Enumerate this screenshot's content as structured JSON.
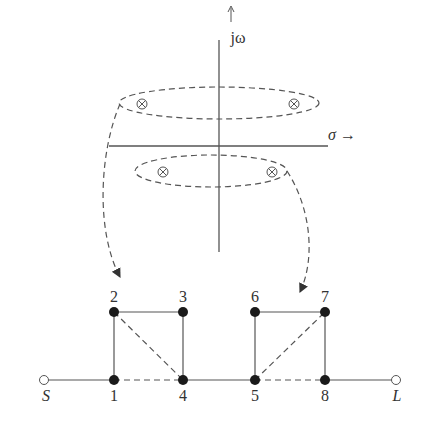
{
  "pole_zero_plot": {
    "axis_labels": {
      "imag": "jω",
      "real": "σ →",
      "imag_arrow": "↑"
    },
    "upper_pair": {
      "marker": "⊗",
      "count": 2
    },
    "lower_pair": {
      "marker": "⊗",
      "count": 2
    }
  },
  "network": {
    "source_label": "S",
    "load_label": "L",
    "nodes": [
      {
        "id": "1",
        "label": "1"
      },
      {
        "id": "2",
        "label": "2"
      },
      {
        "id": "3",
        "label": "3"
      },
      {
        "id": "4",
        "label": "4"
      },
      {
        "id": "5",
        "label": "5"
      },
      {
        "id": "6",
        "label": "6"
      },
      {
        "id": "7",
        "label": "7"
      },
      {
        "id": "8",
        "label": "8"
      }
    ],
    "solid_edges": [
      "S-1",
      "1-2",
      "2-3",
      "3-4",
      "4-5",
      "5-6",
      "6-7",
      "7-8",
      "8-L"
    ],
    "dashed_edges": [
      "1-4",
      "2-4",
      "5-7",
      "5-8"
    ]
  },
  "colors": {
    "line": "#555555",
    "node": "#1a1a1a"
  }
}
